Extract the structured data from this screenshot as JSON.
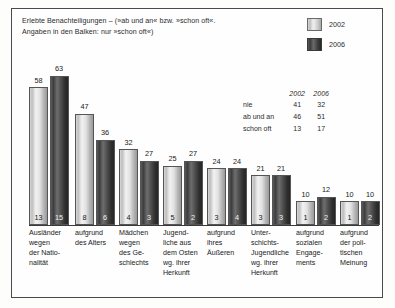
{
  "title": {
    "line1": "Erlebte Benachteiligungen – (»ab und an« bzw. »schon oft«.",
    "line2": "Angaben in den Balken: nur »schon oft«)"
  },
  "legend": {
    "items": [
      {
        "label": "2002",
        "color": "#dcdcdc"
      },
      {
        "label": "2006",
        "color": "#3a3a3a"
      }
    ]
  },
  "side_table": {
    "headers": [
      "",
      "2002",
      "2006"
    ],
    "rows": [
      {
        "label": "nie",
        "v2002": "41",
        "v2006": "32"
      },
      {
        "label": "ab und an",
        "v2002": "46",
        "v2006": "51"
      },
      {
        "label": "schon oft",
        "v2002": "13",
        "v2006": "17"
      }
    ]
  },
  "chart_data": {
    "type": "bar",
    "title": "Erlebte Benachteiligungen – (»ab und an« bzw. »schon oft«. Angaben in den Balken: nur »schon oft«)",
    "xlabel": "",
    "ylabel": "",
    "ylim": [
      0,
      70
    ],
    "grid": false,
    "legend_position": "top-right",
    "categories": [
      "Ausländer wegen der Nationalität",
      "aufgrund des Alters",
      "Mädchen wegen des Geschlechts",
      "Jugendliche aus dem Osten wg. ihrer Herkunft",
      "aufgrund ihres Äußeren",
      "Unterschichts-Jugendliche wg. ihrer Herkunft",
      "aufgrund sozialen Engagements",
      "aufgrund der politischen Meinung"
    ],
    "category_lines": [
      [
        "Ausländer",
        "wegen",
        "der Natio-",
        "nalität"
      ],
      [
        "aufgrund",
        "des Alters"
      ],
      [
        "Mädchen",
        "wegen",
        "des Ge-",
        "schlechts"
      ],
      [
        "Jugend-",
        "liche aus",
        "dem Osten",
        "wg. ihrer",
        "Herkunft"
      ],
      [
        "aufgrund",
        "ihres",
        "Äußeren"
      ],
      [
        "Unter-",
        "schichts-",
        "Jugendliche",
        "wg. ihrer",
        "Herkunft"
      ],
      [
        "aufgrund",
        "sozialen",
        "Engage-",
        "ments"
      ],
      [
        "aufgrund",
        "der poli-",
        "tischen",
        "Meinung"
      ]
    ],
    "series": [
      {
        "name": "2002",
        "values": [
          58,
          47,
          32,
          25,
          24,
          21,
          10,
          10
        ]
      },
      {
        "name": "2006",
        "values": [
          63,
          36,
          27,
          27,
          24,
          21,
          12,
          10
        ]
      }
    ],
    "inner_labels": [
      {
        "name": "2002",
        "values": [
          13,
          8,
          4,
          5,
          3,
          3,
          1,
          1
        ]
      },
      {
        "name": "2006",
        "values": [
          15,
          6,
          3,
          2,
          4,
          3,
          2,
          2
        ]
      }
    ]
  }
}
